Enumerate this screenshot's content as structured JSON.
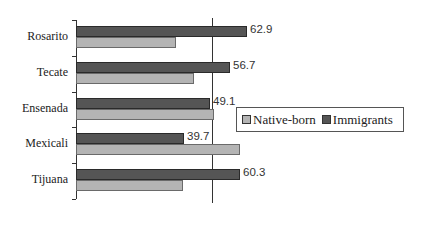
{
  "chart_data": {
    "type": "bar",
    "orientation": "horizontal",
    "title": "",
    "xlabel": "",
    "ylabel": "",
    "categories": [
      "Rosarito",
      "Tecate",
      "Ensenada",
      "Mexicali",
      "Tijuana"
    ],
    "series": [
      {
        "name": "Immigrants",
        "color": "#555555",
        "values": [
          62.9,
          56.7,
          49.1,
          39.7,
          60.3
        ],
        "labels": [
          "62.9",
          "56.7",
          "49.1",
          "39.7",
          "60.3"
        ]
      },
      {
        "name": "Native-born",
        "color": "#b4b4b4",
        "values": [
          36.8,
          43.4,
          50.7,
          60.3,
          39.3
        ]
      }
    ],
    "reference_line": 50,
    "xlim": [
      0,
      80
    ],
    "grid": false,
    "legend": {
      "position": "right",
      "entries": [
        "Native-born",
        "Immigrants"
      ]
    }
  },
  "legend": {
    "native_label": "Native-born",
    "immigrants_label": "Immigrants"
  }
}
